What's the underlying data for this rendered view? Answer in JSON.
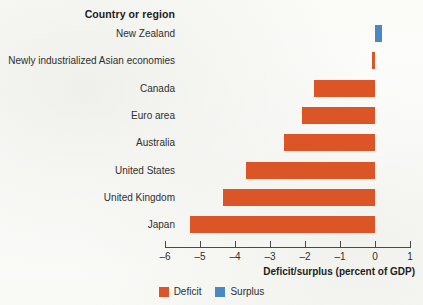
{
  "header": {
    "category_column_title": "Country or region"
  },
  "axis": {
    "title": "Deficit/surplus (percent of GDP)",
    "tick_labels": [
      "–6",
      "–5",
      "–4",
      "–3",
      "–2",
      "–1",
      "0",
      "1"
    ],
    "tick_values": [
      -6,
      -5,
      -4,
      -3,
      -2,
      -1,
      0,
      1
    ]
  },
  "legend": {
    "items": [
      {
        "label": "Deficit",
        "color": "#dc5526"
      },
      {
        "label": "Surplus",
        "color": "#4a87c4"
      }
    ]
  },
  "colors": {
    "deficit": "#dc5526",
    "surplus": "#4a87c4",
    "axis": "#4a4a4a",
    "background": "#fdfdfb"
  },
  "chart_data": {
    "type": "bar",
    "orientation": "horizontal",
    "title": "",
    "subtitle": "",
    "xlabel": "Deficit/surplus (percent of GDP)",
    "ylabel": "Country or region",
    "xlim": [
      -6,
      1
    ],
    "xticks": [
      -6,
      -5,
      -4,
      -3,
      -2,
      -1,
      0,
      1
    ],
    "grid": false,
    "legend_position": "bottom-center",
    "categories": [
      "New Zealand",
      "Newly industrialized Asian economies",
      "Canada",
      "Euro area",
      "Australia",
      "United States",
      "United Kingdom",
      "Japan"
    ],
    "values": [
      0.2,
      -0.1,
      -1.75,
      -2.1,
      -2.6,
      -3.7,
      -4.35,
      -5.3
    ],
    "point_types": [
      "surplus",
      "deficit",
      "deficit",
      "deficit",
      "deficit",
      "deficit",
      "deficit",
      "deficit"
    ],
    "series": [
      {
        "name": "Deficit",
        "color": "#dc5526",
        "values": [
          null,
          -0.1,
          -1.75,
          -2.1,
          -2.6,
          -3.7,
          -4.35,
          -5.3
        ]
      },
      {
        "name": "Surplus",
        "color": "#4a87c4",
        "values": [
          0.2,
          null,
          null,
          null,
          null,
          null,
          null,
          null
        ]
      }
    ]
  }
}
